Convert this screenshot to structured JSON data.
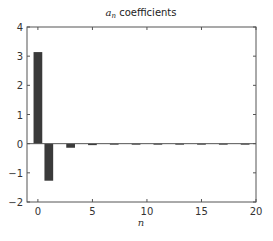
{
  "chart_data": {
    "type": "bar",
    "title_main": "a",
    "title_sub": "n",
    "title_rest": " coefficients",
    "xlabel": "n",
    "ylabel": "",
    "xlim": [
      -1,
      20
    ],
    "ylim": [
      -2,
      4
    ],
    "xticks": [
      0,
      5,
      10,
      15,
      20
    ],
    "yticks": [
      -2,
      -1,
      0,
      1,
      2,
      3,
      4
    ],
    "grid": false,
    "legend": null,
    "bar_color": "#3a3a3a",
    "x": [
      0,
      1,
      2,
      3,
      4,
      5,
      6,
      7,
      8,
      9,
      10,
      11,
      12,
      13,
      14,
      15,
      16,
      17,
      18,
      19,
      20
    ],
    "values": [
      3.14,
      -1.27,
      0,
      -0.14,
      0,
      -0.05,
      0,
      -0.03,
      0,
      -0.016,
      0,
      -0.011,
      0,
      -0.008,
      0,
      -0.006,
      0,
      -0.004,
      0,
      -0.004,
      0
    ]
  }
}
